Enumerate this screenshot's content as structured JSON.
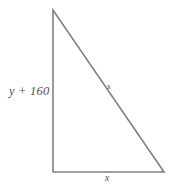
{
  "figure": {
    "type": "right-triangle-diagram",
    "background_color": "#ffffff",
    "stroke_color": "#808080",
    "label_color": "#4d4d4d",
    "labels": {
      "vertical_leg": "y + 160",
      "hypotenuse": "s",
      "base": "x"
    },
    "geometry": {
      "apex": "53,10",
      "bottom_left": "53,172",
      "bottom_right": "164,172",
      "polyline_points": "53,10 53,172 164,172 53,10"
    }
  }
}
